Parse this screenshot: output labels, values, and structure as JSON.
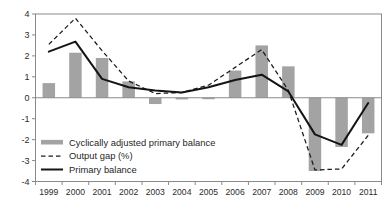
{
  "chart_data": {
    "type": "bar",
    "title": "",
    "subtitle": "",
    "xlabel": "",
    "ylabel": "",
    "categories": [
      "1999",
      "2000",
      "2001",
      "2002",
      "2003",
      "2004",
      "2005",
      "2006",
      "2007",
      "2008",
      "2009",
      "2010",
      "2011"
    ],
    "ylim": [
      -4,
      4
    ],
    "ytick_labels": [
      "4",
      "3",
      "2",
      "1",
      "0",
      "-1",
      "-2",
      "-3",
      "-4"
    ],
    "ytick_values": [
      4,
      3,
      2,
      1,
      0,
      -1,
      -2,
      -3,
      -4
    ],
    "grid": false,
    "zero_line": true,
    "legend_position": "inside-lower-left",
    "series": [
      {
        "name": "Cyclically adjusted primary balance",
        "kind": "bar",
        "color": "#a3a3a3",
        "values": [
          0.7,
          2.15,
          1.9,
          0.78,
          -0.3,
          -0.08,
          -0.07,
          1.3,
          2.5,
          1.5,
          -3.5,
          -2.35,
          -1.7
        ]
      },
      {
        "name": "Output gap (%)",
        "kind": "line",
        "style": "dashed",
        "color": "#1a1a1a",
        "values": [
          2.55,
          3.8,
          2.25,
          0.8,
          0.2,
          0.25,
          0.6,
          1.45,
          2.3,
          0.35,
          -3.45,
          -3.4,
          -1.8
        ]
      },
      {
        "name": "Primary balance",
        "kind": "line",
        "style": "solid",
        "color": "#141414",
        "values": [
          2.2,
          2.68,
          0.9,
          0.5,
          0.35,
          0.25,
          0.5,
          0.85,
          1.1,
          0.3,
          -1.75,
          -2.25,
          -0.25
        ]
      }
    ]
  },
  "legend": {
    "items": [
      {
        "label": "Cyclically adjusted primary balance",
        "marker": "bar-swatch"
      },
      {
        "label": "Output gap (%)",
        "marker": "dashed-line"
      },
      {
        "label": "Primary balance",
        "marker": "solid-line"
      }
    ]
  },
  "colors": {
    "bar": "#a3a3a3",
    "line_primary": "#141414",
    "line_output_gap": "#1a1a1a",
    "axis": "#8a8a8a",
    "text": "#2b2b2b",
    "background": "#ffffff"
  }
}
